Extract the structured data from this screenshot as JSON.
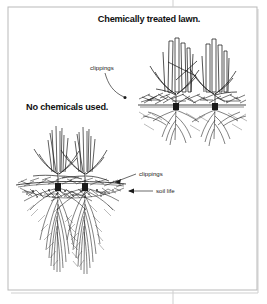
{
  "figure": {
    "name": "lawn-root-comparison",
    "background_color": "#ffffff",
    "ink_color": "#1a1a1a",
    "frame_color": "#b9b9b9",
    "frame_shadow_color": "#cfcfcf"
  },
  "captions": {
    "treated_title": "Chemically treated lawn.",
    "untreated_title": "No chemicals used."
  },
  "annotations": {
    "clippings_top": "clippings",
    "clippings_bottom": "clippings",
    "soil_life": "soil life"
  },
  "panels": [
    {
      "id": "treated",
      "title": "Chemically treated lawn.",
      "tufts": 2,
      "blade_style": "blunt-cut-thick",
      "clippings_layer": "thick-coarse-straw",
      "root_density": "sparse",
      "root_depth": "shallow"
    },
    {
      "id": "untreated",
      "title": "No chemicals used.",
      "tufts": 2,
      "blade_style": "slender-tapered",
      "clippings_layer": "thin-decomposing",
      "root_density": "dense",
      "root_depth": "deep"
    }
  ]
}
